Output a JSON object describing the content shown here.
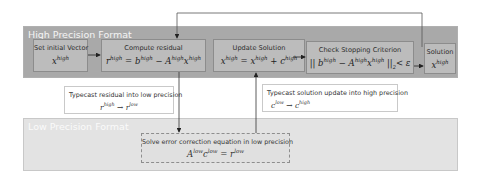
{
  "diagram": {
    "high_panel": {
      "title": "High Precision Format"
    },
    "low_panel": {
      "title": "Low Precision Format"
    },
    "steps": [
      {
        "label": "Set initial Vector",
        "equation": "x^high"
      },
      {
        "label": "Compute residual",
        "equation": "r^high = b^high − A^high x^high"
      },
      {
        "label": "Update Solution",
        "equation": "x^high = x^high + c^high"
      },
      {
        "label": "Check Stopping Criterion",
        "equation": "|| b^high − A^high x^high ||₂ < ε"
      },
      {
        "label": "Solution",
        "equation": "x^high"
      }
    ],
    "notes": [
      {
        "label": "Typecast residual into low precision",
        "equation": "r^high → r^low"
      },
      {
        "label": "Typecast solution update into high precision",
        "equation": "c^low → c^high"
      }
    ],
    "low_step": {
      "label": "Solve error correction equation in low precision",
      "equation": "A^low c^low = r^low"
    },
    "colors": {
      "high_panel_bg": "#a9a9a9",
      "low_panel_bg": "#e3e3e3",
      "step_box_bg": "#bcbcbc",
      "arrow": "#222222",
      "panel_title": "#f4f4f4"
    }
  }
}
